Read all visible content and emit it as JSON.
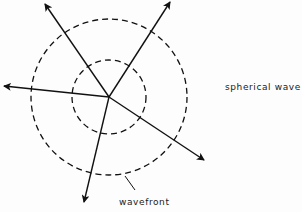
{
  "diagram": {
    "labels": {
      "spherical_wave": "spherical wave",
      "wavefront": "wavefront"
    },
    "source": {
      "x": 109,
      "y": 97
    },
    "wavefronts": [
      {
        "name": "inner",
        "cx": 109,
        "cy": 97,
        "r": 37
      },
      {
        "name": "outer",
        "cx": 109,
        "cy": 97,
        "r": 78
      }
    ],
    "rays": [
      {
        "name": "up-left",
        "x2": 45,
        "y2": 4
      },
      {
        "name": "up-right",
        "x2": 170,
        "y2": 2
      },
      {
        "name": "left",
        "x2": 4,
        "y2": 86
      },
      {
        "name": "down-right",
        "x2": 204,
        "y2": 160
      },
      {
        "name": "down",
        "x2": 84,
        "y2": 202
      }
    ],
    "colors": {
      "line": "#111111",
      "background": "#fdfdfd"
    }
  }
}
